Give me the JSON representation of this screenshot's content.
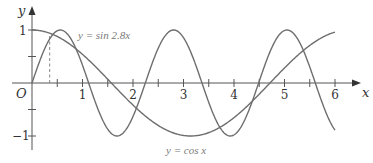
{
  "chart_data": {
    "type": "line",
    "title": "",
    "xlabel": "x",
    "ylabel": "y",
    "origin_label": "O",
    "xlim": [
      0,
      6.4
    ],
    "ylim": [
      -1.2,
      1.2
    ],
    "grid": false,
    "x_ticks": [
      0.5,
      1,
      1.5,
      2,
      2.5,
      3,
      3.5,
      4,
      4.5,
      5,
      5.5,
      6
    ],
    "x_tick_labels": [
      {
        "value": 1,
        "label": "1"
      },
      {
        "value": 2,
        "label": "2"
      },
      {
        "value": 3,
        "label": "3"
      },
      {
        "value": 4,
        "label": "4"
      },
      {
        "value": 5,
        "label": "5"
      },
      {
        "value": 6,
        "label": "6"
      }
    ],
    "y_ticks": [
      -1,
      -0.5,
      0.5,
      1
    ],
    "y_tick_labels": [
      {
        "value": 1,
        "label": "1"
      },
      {
        "value": -1,
        "label": "−1"
      }
    ],
    "series": [
      {
        "name": "y = sin 2.8x",
        "function": "sin(2.8x)",
        "x_range": [
          0,
          6
        ],
        "label": "y = sin 2.8x"
      },
      {
        "name": "y = cos x",
        "function": "cos(x)",
        "x_range": [
          0,
          6
        ],
        "label": "y = cos x"
      }
    ],
    "annotations": [
      {
        "type": "dashed-vertical",
        "x": 0.35,
        "from_y": 0,
        "to_y": 0.94,
        "note": "first intersection of sin 2.8x and cos x"
      }
    ],
    "color": "#666666"
  },
  "labels": {
    "y_axis": "y",
    "x_axis": "x",
    "origin": "O",
    "y_one": "1",
    "y_minus_one": "−1",
    "sin_curve": "y = sin 2.8x",
    "cos_curve": "y = cos x"
  }
}
